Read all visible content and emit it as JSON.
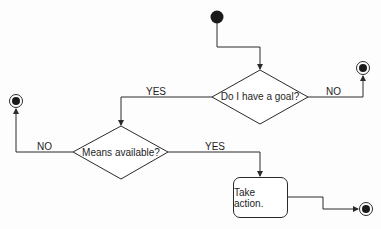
{
  "diagram": {
    "type": "activity-diagram",
    "colors": {
      "line": "#2a2a2a",
      "fill": "#ffffff",
      "node": "#1a1a1a",
      "text": "#1e1e1e"
    },
    "start": {
      "label": "start"
    },
    "decisions": [
      {
        "id": "goal",
        "text": "Do I have a goal?"
      },
      {
        "id": "means",
        "text": "Means available?"
      }
    ],
    "action": {
      "text": "Take action."
    },
    "edges": [
      {
        "from": "start",
        "to": "goal",
        "label": ""
      },
      {
        "from": "goal",
        "to": "means",
        "label": "YES"
      },
      {
        "from": "goal",
        "to": "end-1",
        "label": "NO"
      },
      {
        "from": "means",
        "to": "action",
        "label": "YES"
      },
      {
        "from": "means",
        "to": "end-2",
        "label": "NO"
      },
      {
        "from": "action",
        "to": "end-3",
        "label": ""
      }
    ],
    "end_nodes": [
      "end-1",
      "end-2",
      "end-3"
    ]
  }
}
